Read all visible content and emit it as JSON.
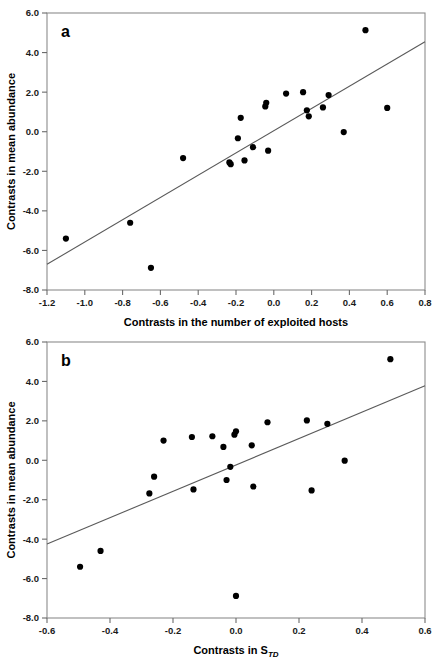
{
  "figure": {
    "background": "#ffffff",
    "point_color": "#000000",
    "line_color": "#5a5a5a",
    "axis_color": "#6b6b6b"
  },
  "chart_data": [
    {
      "type": "scatter",
      "panel_label": "a",
      "title": "",
      "xlabel": "Contrasts in the number of exploited hosts",
      "xlabel_sub": "",
      "ylabel": "Contrasts in mean abundance",
      "xlim": [
        -1.2,
        0.8
      ],
      "ylim": [
        -8.0,
        6.0
      ],
      "xticks": [
        -1.2,
        -1.0,
        -0.8,
        -0.6,
        -0.4,
        -0.2,
        0.0,
        0.2,
        0.4,
        0.6,
        0.8
      ],
      "xticklabels": [
        "-1.2",
        "-1.0",
        "-0.8",
        "-0.6",
        "-0.4",
        "-0.2",
        "0.0",
        "0.2",
        "0.4",
        "0.6",
        "0.8"
      ],
      "yticks": [
        6.0,
        4.0,
        2.0,
        0.0,
        -2.0,
        -4.0,
        -6.0,
        -8.0
      ],
      "yticklabels": [
        "6.0",
        "4.0",
        "2.0",
        "0.0",
        "-2.0",
        "-4.0",
        "-6.0",
        "-8.0"
      ],
      "grid": false,
      "legend": null,
      "points": [
        [
          -1.1,
          -5.4
        ],
        [
          -0.76,
          -4.6
        ],
        [
          -0.65,
          -6.88
        ],
        [
          -0.48,
          -1.33
        ],
        [
          -0.235,
          -1.55
        ],
        [
          -0.228,
          -1.64
        ],
        [
          -0.19,
          -0.33
        ],
        [
          -0.175,
          0.7
        ],
        [
          -0.155,
          -1.45
        ],
        [
          -0.11,
          -0.78
        ],
        [
          -0.045,
          1.28
        ],
        [
          -0.04,
          1.46
        ],
        [
          -0.03,
          -0.96
        ],
        [
          0.065,
          1.93
        ],
        [
          0.155,
          2.0
        ],
        [
          0.175,
          1.08
        ],
        [
          0.185,
          0.78
        ],
        [
          0.26,
          1.23
        ],
        [
          0.29,
          1.85
        ],
        [
          0.37,
          -0.02
        ],
        [
          0.485,
          5.13
        ],
        [
          0.6,
          1.2
        ]
      ],
      "fit_line": {
        "x": [
          -1.2,
          0.8
        ],
        "y": [
          -6.7,
          4.55
        ]
      }
    },
    {
      "type": "scatter",
      "panel_label": "b",
      "title": "",
      "xlabel": "Contrasts in S",
      "xlabel_sub": "TD",
      "ylabel": "Contrasts in mean abundance",
      "xlim": [
        -0.6,
        0.6
      ],
      "ylim": [
        -8.0,
        6.0
      ],
      "xticks": [
        -0.6,
        -0.4,
        -0.2,
        0.0,
        0.2,
        0.4,
        0.6
      ],
      "xticklabels": [
        "-0.6",
        "-0.4",
        "-0.2",
        "0.0",
        "0.2",
        "0.4",
        "0.6"
      ],
      "yticks": [
        6.0,
        4.0,
        2.0,
        0.0,
        -2.0,
        -4.0,
        -6.0,
        -8.0
      ],
      "yticklabels": [
        "6.0",
        "4.0",
        "2.0",
        "0.0",
        "-2.0",
        "-4.0",
        "-6.0",
        "-8.0"
      ],
      "grid": false,
      "legend": null,
      "points": [
        [
          -0.495,
          -5.4
        ],
        [
          -0.43,
          -4.6
        ],
        [
          -0.275,
          -1.68
        ],
        [
          -0.26,
          -0.83
        ],
        [
          -0.23,
          1.0
        ],
        [
          -0.14,
          1.18
        ],
        [
          -0.135,
          -1.48
        ],
        [
          -0.075,
          1.22
        ],
        [
          -0.04,
          0.68
        ],
        [
          -0.03,
          -1.0
        ],
        [
          -0.018,
          -0.33
        ],
        [
          -0.005,
          1.3
        ],
        [
          0.0,
          1.47
        ],
        [
          0.0,
          -6.88
        ],
        [
          0.05,
          0.76
        ],
        [
          0.055,
          -1.33
        ],
        [
          0.1,
          1.93
        ],
        [
          0.225,
          2.02
        ],
        [
          0.24,
          -1.53
        ],
        [
          0.29,
          1.85
        ],
        [
          0.345,
          -0.02
        ],
        [
          0.49,
          5.13
        ]
      ],
      "fit_line": {
        "x": [
          -0.6,
          0.6
        ],
        "y": [
          -4.25,
          3.78
        ]
      }
    }
  ]
}
